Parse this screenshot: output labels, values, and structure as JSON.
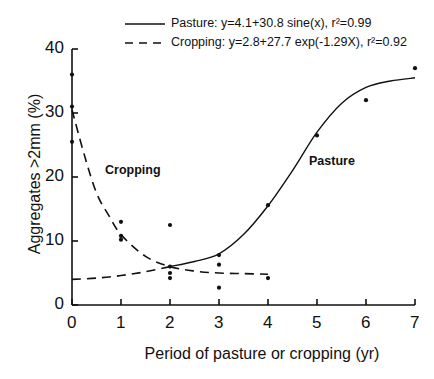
{
  "chart_data": {
    "type": "scatter",
    "title": "",
    "xlabel": "Period of pasture or cropping (yr)",
    "ylabel": "Aggregates >2mm (%)",
    "xlim": [
      0,
      7
    ],
    "ylim": [
      0,
      40
    ],
    "x_ticks": [
      "0",
      "1",
      "2",
      "3",
      "4",
      "5",
      "6",
      "7"
    ],
    "y_ticks": [
      "0",
      "10",
      "20",
      "30",
      "40"
    ],
    "grid": false,
    "legend_position": "top",
    "legend": [
      {
        "name": "Pasture",
        "style": "solid",
        "label": "Pasture: y=4.1+30.8 sine(x), r²=0.99"
      },
      {
        "name": "Cropping",
        "style": "dashed",
        "label": "Cropping: y=2.8+27.7 exp(-1.29X), r²=0.92"
      }
    ],
    "annotations": [
      {
        "text": "Cropping",
        "x": 0.7,
        "y": 21
      },
      {
        "text": "Pasture",
        "x": 4.9,
        "y": 22
      }
    ],
    "series": [
      {
        "name": "Observed",
        "type": "scatter",
        "points": [
          [
            0,
            36
          ],
          [
            0,
            31
          ],
          [
            0,
            25.5
          ],
          [
            1,
            13
          ],
          [
            1,
            10.8
          ],
          [
            1,
            10.2
          ],
          [
            2,
            12.5
          ],
          [
            2,
            6
          ],
          [
            2,
            5
          ],
          [
            2,
            4.2
          ],
          [
            3,
            7.8
          ],
          [
            3,
            6.3
          ],
          [
            3,
            2.7
          ],
          [
            4,
            15.6
          ],
          [
            4,
            4.2
          ],
          [
            5,
            26.5
          ],
          [
            6,
            32
          ],
          [
            7,
            37
          ]
        ]
      },
      {
        "name": "Pasture fit",
        "type": "line",
        "style": "solid",
        "x": [
          2,
          2.5,
          3,
          3.5,
          4,
          4.5,
          5,
          5.5,
          6,
          6.5,
          7
        ],
        "y": [
          6,
          6.8,
          8,
          11,
          15.5,
          21,
          27,
          31.5,
          34,
          35,
          35.5
        ]
      },
      {
        "name": "Cropping fit",
        "type": "line",
        "style": "dashed",
        "x": [
          0,
          0.25,
          0.5,
          0.75,
          1,
          1.5,
          2,
          2.5,
          3,
          3.5,
          4
        ],
        "y": [
          30.5,
          23.5,
          17.5,
          14,
          11,
          7.6,
          6,
          5.3,
          5,
          4.9,
          4.8
        ]
      },
      {
        "name": "Pasture fit (early)",
        "type": "line",
        "style": "dashed",
        "x": [
          0,
          0.5,
          1,
          1.5,
          2
        ],
        "y": [
          4,
          4.2,
          4.6,
          5.2,
          6
        ]
      }
    ]
  },
  "legend": {
    "pasture": "Pasture: y=4.1+30.8 sine(x), r²=0.99",
    "cropping": "Cropping: y=2.8+27.7 exp(-1.29X), r²=0.92"
  },
  "axes": {
    "xlabel": "Period of pasture or cropping (yr)",
    "ylabel": "Aggregates >2mm (%)"
  },
  "annotations": {
    "cropping": "Cropping",
    "pasture": "Pasture"
  }
}
